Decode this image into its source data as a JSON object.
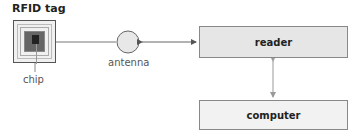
{
  "diagram": {
    "title": "RFID tag",
    "labels": {
      "chip": "chip",
      "antenna": "antenna"
    },
    "boxes": {
      "reader": "reader",
      "computer": "computer"
    },
    "connections": [
      {
        "from": "RFID tag",
        "to": "antenna",
        "type": "line"
      },
      {
        "from": "antenna",
        "to": "reader",
        "type": "bidirectional-arrow"
      },
      {
        "from": "reader",
        "to": "computer",
        "type": "bidirectional-arrow"
      }
    ],
    "colors": {
      "reader_fill": "#e6e6e6",
      "computer_fill": "#f2f2f2",
      "antenna_fill": "#e8e8e8",
      "line": "#666666",
      "arrow_light": "#999999"
    }
  }
}
